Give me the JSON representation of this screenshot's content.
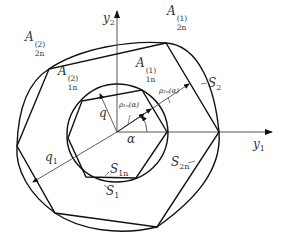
{
  "diagram": {
    "axes": {
      "x_label": {
        "base": "y",
        "sub": "1"
      },
      "y_label": {
        "base": "y",
        "sub": "2"
      },
      "origin": [
        117,
        132
      ]
    },
    "labels": {
      "A2n1": {
        "base": "A",
        "sup": "(1)",
        "sub": "2n"
      },
      "A2n2": {
        "base": "A",
        "sup": "(2)",
        "sub": "2n"
      },
      "A1n1": {
        "base": "A",
        "sup": "(1)",
        "sub": "1n"
      },
      "A1n2": {
        "base": "A",
        "sup": "(2)",
        "sub": "1n"
      },
      "S2": {
        "base": "S",
        "sub": "2"
      },
      "S1": {
        "base": "S",
        "sub": "1"
      },
      "S1n": {
        "base": "S",
        "sub": "1n"
      },
      "S2n": {
        "base": "S",
        "sub": "2n"
      },
      "q": {
        "base": "q"
      },
      "q1": {
        "base": "q",
        "sub": "1"
      },
      "alpha": {
        "base": "α"
      },
      "rho1n": {
        "text": "ρ₁ₙ(α)"
      },
      "rho2n": {
        "text": "ρ₂ₙ(α)"
      }
    },
    "outer_polygon": [
      [
        166,
        43
      ],
      [
        49,
        69
      ],
      [
        17,
        146
      ],
      [
        55,
        213
      ],
      [
        157,
        227
      ],
      [
        219,
        132
      ]
    ],
    "inner_polygon": [
      [
        82,
        101
      ],
      [
        142,
        90
      ],
      [
        167,
        132
      ],
      [
        136,
        178
      ],
      [
        86,
        177
      ],
      [
        68,
        138
      ]
    ],
    "inner_curve_S1": "circle-like closed curve around inner polygon",
    "outer_curve_S2": "smooth closed curve around outer polygon",
    "colors": {
      "stroke": "#111111",
      "axis": "#333333",
      "text": "#333333"
    }
  }
}
